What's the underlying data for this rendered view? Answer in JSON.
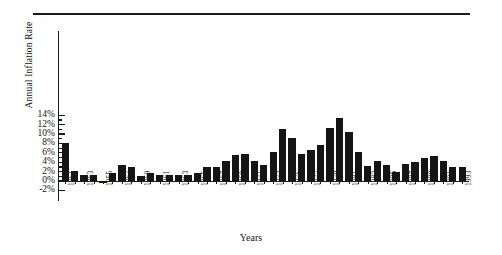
{
  "chart": {
    "title": "",
    "ylabel": "Annual Inflation Rate",
    "xlabel": "Years"
  },
  "chart_data": {
    "type": "bar",
    "title": "",
    "xlabel": "Years",
    "ylabel": "Annual Inflation Rate",
    "ylim": [
      -2,
      14
    ],
    "ytick_labels": [
      "-2%",
      "0%",
      "2%",
      "4%",
      "6%",
      "8%",
      "10%",
      "12%",
      "14%"
    ],
    "ytick_values": [
      -2,
      0,
      2,
      4,
      6,
      8,
      10,
      12,
      14
    ],
    "grid": false,
    "legend": null,
    "bar_color": "#151515",
    "xtick_labels": [
      "1951",
      "1953",
      "1955",
      "1957",
      "1959",
      "1961",
      "1963",
      "1965",
      "1967",
      "1969",
      "1971",
      "1973",
      "1975",
      "1977",
      "1979",
      "1981",
      "1983",
      "1985",
      "1987",
      "1989",
      "1991",
      "1993"
    ],
    "xtick_label_rotation": 90,
    "categories": [
      "1951",
      "1952",
      "1953",
      "1954",
      "1955",
      "1956",
      "1957",
      "1958",
      "1959",
      "1960",
      "1961",
      "1962",
      "1963",
      "1964",
      "1965",
      "1966",
      "1967",
      "1968",
      "1969",
      "1970",
      "1971",
      "1972",
      "1973",
      "1974",
      "1975",
      "1976",
      "1977",
      "1978",
      "1979",
      "1980",
      "1981",
      "1982",
      "1983",
      "1984",
      "1985",
      "1986",
      "1987",
      "1988",
      "1989",
      "1990",
      "1991",
      "1992",
      "1993"
    ],
    "values": [
      8.0,
      2.2,
      1.2,
      1.2,
      -0.5,
      1.8,
      3.5,
      3.0,
      1.0,
      1.6,
      1.2,
      1.2,
      1.3,
      1.3,
      1.8,
      3.0,
      2.9,
      4.2,
      5.5,
      5.8,
      4.3,
      3.3,
      6.2,
      11.0,
      9.2,
      5.8,
      6.5,
      7.6,
      11.3,
      13.5,
      10.4,
      6.2,
      3.2,
      4.3,
      3.5,
      1.9,
      3.7,
      4.1,
      4.8,
      5.4,
      4.2,
      3.0,
      3.0
    ]
  }
}
